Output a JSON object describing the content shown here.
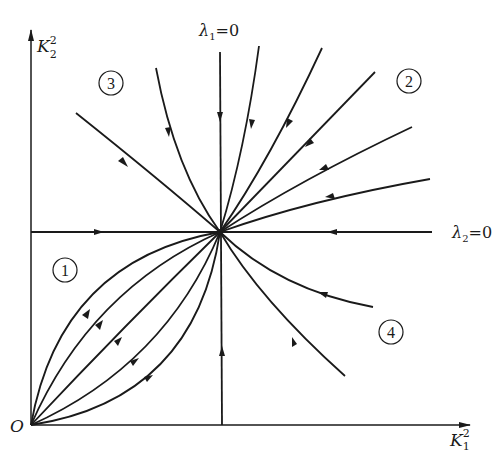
{
  "diagram": {
    "type": "phase-portrait",
    "origin_label": "O",
    "x_axis": {
      "label_base": "K",
      "label_sup": "2",
      "label_sub": "1"
    },
    "y_axis": {
      "label_base": "K",
      "label_sup": "2",
      "label_sub": "2"
    },
    "lines": {
      "lambda1": {
        "label_base": "λ",
        "label_sub": "1",
        "label_eq": "=0"
      },
      "lambda2": {
        "label_base": "λ",
        "label_sub": "2",
        "label_eq": "=0"
      }
    },
    "regions": [
      {
        "id": "1",
        "label": "1"
      },
      {
        "id": "2",
        "label": "2"
      },
      {
        "id": "3",
        "label": "3"
      },
      {
        "id": "4",
        "label": "4"
      }
    ],
    "colors": {
      "ink": "#1a1a1a",
      "background": "#ffffff"
    }
  }
}
